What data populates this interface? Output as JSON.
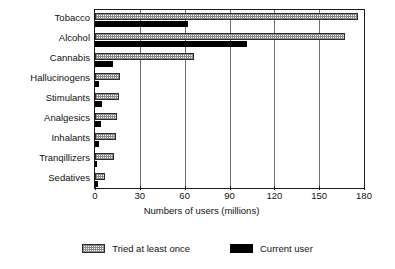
{
  "chart_data": {
    "type": "bar",
    "orientation": "horizontal",
    "title": "",
    "xlabel": "Numbers of users (millions)",
    "ylabel": "",
    "xlim": [
      0,
      180
    ],
    "xticks": [
      0,
      30,
      60,
      90,
      120,
      150,
      180
    ],
    "grid": true,
    "legend_position": "bottom",
    "categories": [
      "Tobacco",
      "Alcohol",
      "Cannabis",
      "Hallucinogens",
      "Stimulants",
      "Analgesics",
      "Inhalants",
      "Tranqillizers",
      "Sedatives"
    ],
    "series": [
      {
        "name": "Tried at least once",
        "fill": "hatched",
        "color": "#8a8a8a",
        "values": [
          176,
          167,
          66,
          17,
          16,
          14.5,
          14,
          13,
          7
        ]
      },
      {
        "name": "Current user",
        "fill": "solid",
        "color": "#000000",
        "values": [
          62,
          102,
          12,
          3,
          4.5,
          4,
          2.5,
          1.5,
          2
        ]
      }
    ]
  },
  "legend": {
    "items": [
      {
        "label": "Tried at least once",
        "swatch": "hatched-swatch"
      },
      {
        "label": "Current user",
        "swatch": "black-swatch"
      }
    ]
  },
  "axis": {
    "x_title": "Numbers of users (millions)",
    "tick_labels": [
      "0",
      "30",
      "60",
      "90",
      "120",
      "150",
      "180"
    ]
  }
}
